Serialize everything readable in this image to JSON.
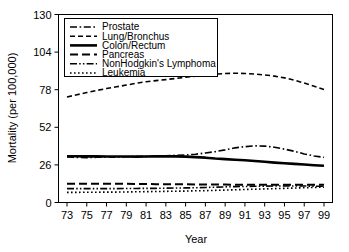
{
  "chart_data": {
    "type": "line",
    "title": "",
    "xlabel": "Year",
    "ylabel": "Mortality (per 100,000)",
    "xlim": [
      73,
      99
    ],
    "ylim": [
      0,
      130
    ],
    "grid": false,
    "legend_position": "top-left",
    "xticks": [
      73,
      75,
      77,
      79,
      81,
      83,
      85,
      87,
      89,
      91,
      93,
      95,
      97,
      99
    ],
    "xtick_labels": [
      "73",
      "75",
      "77",
      "79",
      "81",
      "83",
      "85",
      "87",
      "89",
      "91",
      "93",
      "95",
      "97",
      "99"
    ],
    "yticks": [
      0,
      26,
      52,
      78,
      104,
      130
    ],
    "ytick_labels": [
      "0",
      "26",
      "52",
      "78",
      "104",
      "130"
    ],
    "x": [
      73,
      74,
      75,
      76,
      77,
      78,
      79,
      80,
      81,
      82,
      83,
      84,
      85,
      86,
      87,
      88,
      89,
      90,
      91,
      92,
      93,
      94,
      95,
      96,
      97,
      98,
      99
    ],
    "series": [
      {
        "name": "Prostate",
        "style": "dashdot",
        "width": 1.6,
        "values": [
          31.5,
          31.2,
          31.0,
          31.3,
          31.5,
          31.4,
          31.6,
          31.8,
          31.9,
          32.0,
          32.3,
          32.6,
          32.9,
          33.4,
          34.2,
          35.2,
          36.4,
          37.8,
          38.6,
          39.2,
          39.0,
          38.2,
          36.9,
          35.4,
          33.6,
          32.2,
          31.2
        ]
      },
      {
        "name": "Lung/Bronchus",
        "style": "dashed",
        "width": 1.6,
        "values": [
          73.0,
          74.5,
          76.0,
          77.5,
          78.8,
          80.0,
          81.2,
          82.5,
          83.5,
          84.3,
          85.0,
          85.8,
          86.6,
          87.4,
          88.2,
          88.8,
          89.2,
          89.4,
          89.2,
          88.8,
          88.2,
          87.4,
          86.2,
          84.6,
          82.6,
          80.4,
          78.2
        ]
      },
      {
        "name": "Colon/Rectum",
        "style": "solid",
        "width": 2.6,
        "values": [
          32.0,
          32.0,
          31.9,
          31.9,
          31.8,
          31.8,
          31.8,
          31.7,
          31.8,
          31.9,
          32.0,
          31.9,
          31.7,
          31.4,
          31.0,
          30.4,
          30.0,
          29.6,
          29.2,
          28.7,
          28.2,
          27.6,
          27.1,
          26.7,
          26.3,
          25.8,
          25.4
        ]
      },
      {
        "name": "Pancreas",
        "style": "longdash",
        "width": 2.0,
        "values": [
          13.0,
          13.0,
          13.0,
          13.0,
          13.0,
          12.9,
          12.9,
          12.8,
          12.8,
          12.7,
          12.7,
          12.6,
          12.6,
          12.5,
          12.5,
          12.4,
          12.4,
          12.3,
          12.3,
          12.3,
          12.2,
          12.2,
          12.2,
          12.2,
          12.2,
          12.2,
          12.2
        ]
      },
      {
        "name": "NonHodgkin's Lymphoma",
        "style": "dashdotdot",
        "width": 1.6,
        "values": [
          9.6,
          9.6,
          9.6,
          9.6,
          9.6,
          9.6,
          9.7,
          9.7,
          9.8,
          9.8,
          9.9,
          10.0,
          10.1,
          10.2,
          10.4,
          10.6,
          10.8,
          11.0,
          11.1,
          11.2,
          11.3,
          11.4,
          11.4,
          11.4,
          11.4,
          11.3,
          11.2
        ]
      },
      {
        "name": "Leukemia",
        "style": "dotted",
        "width": 1.6,
        "values": [
          7.0,
          7.0,
          7.1,
          7.1,
          7.2,
          7.2,
          7.3,
          7.4,
          7.5,
          7.6,
          7.7,
          7.8,
          7.9,
          8.1,
          8.2,
          8.4,
          8.6,
          8.8,
          9.0,
          9.2,
          9.4,
          9.6,
          9.8,
          10.0,
          10.2,
          10.4,
          10.6
        ]
      }
    ]
  },
  "legend": {
    "items": [
      {
        "label": "Prostate"
      },
      {
        "label": "Lung/Bronchus"
      },
      {
        "label": "Colon/Rectum"
      },
      {
        "label": "Pancreas"
      },
      {
        "label": "NonHodgkin's Lymphoma"
      },
      {
        "label": "Leukemia"
      }
    ]
  },
  "colors": {
    "line": "#000000",
    "frame": "#000000",
    "background": "#ffffff"
  }
}
